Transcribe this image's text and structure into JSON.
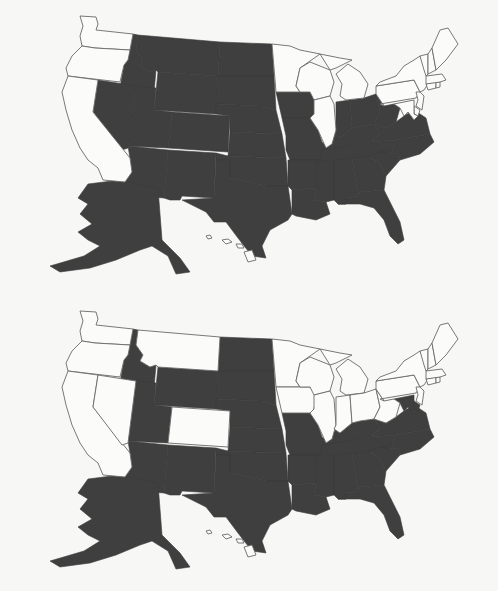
{
  "colors": {
    "shaded": "#3f3f3f",
    "unshaded": "#fbfbf9",
    "border": "#6a6a6a",
    "background": "#f7f7f5"
  },
  "maps": [
    {
      "name": "map-top",
      "shaded_states": [
        "MT",
        "ID",
        "WY",
        "NV",
        "UT",
        "CO",
        "AZ",
        "NM",
        "ND",
        "SD",
        "NE",
        "KS",
        "OK",
        "TX",
        "IA",
        "MO",
        "AR",
        "LA",
        "IN",
        "OH",
        "KY",
        "TN",
        "MS",
        "AL",
        "GA",
        "FL",
        "SC",
        "NC",
        "VA",
        "WV",
        "AK"
      ],
      "unshaded_states": [
        "WA",
        "OR",
        "CA",
        "MN",
        "WI",
        "IL",
        "MI",
        "PA",
        "NY",
        "NJ",
        "DE",
        "MD",
        "CT",
        "RI",
        "MA",
        "VT",
        "NH",
        "ME",
        "HI"
      ]
    },
    {
      "name": "map-bottom",
      "shaded_states": [
        "ID",
        "UT",
        "AZ",
        "NM",
        "WY",
        "ND",
        "SD",
        "NE",
        "KS",
        "OK",
        "TX",
        "MO",
        "AR",
        "LA",
        "KY",
        "TN",
        "MS",
        "AL",
        "GA",
        "FL",
        "SC",
        "NC",
        "VA",
        "MD",
        "DE",
        "AK"
      ],
      "unshaded_states": [
        "WA",
        "OR",
        "CA",
        "NV",
        "MT",
        "CO",
        "MN",
        "IA",
        "WI",
        "IL",
        "MI",
        "IN",
        "OH",
        "WV",
        "PA",
        "NY",
        "NJ",
        "CT",
        "RI",
        "MA",
        "VT",
        "NH",
        "ME",
        "HI"
      ]
    }
  ]
}
